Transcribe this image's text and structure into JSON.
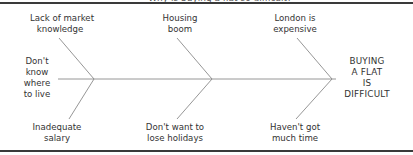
{
  "page": {
    "clipped_caption": "Why is buying a flat so difficult?"
  },
  "diagram": {
    "type": "fishbone",
    "effect": [
      "BUYING",
      "A FLAT",
      "IS",
      "DIFFICULT"
    ],
    "causes_top": [
      {
        "lines": [
          "Lack of market",
          "knowledge"
        ]
      },
      {
        "lines": [
          "Housing",
          "boom"
        ]
      },
      {
        "lines": [
          "London is",
          "expensive"
        ]
      }
    ],
    "cause_left": {
      "lines": [
        "Don't",
        "know",
        "where",
        "to live"
      ]
    },
    "causes_bottom": [
      {
        "lines": [
          "Inadequate",
          "salary"
        ]
      },
      {
        "lines": [
          "Don't want to",
          "lose holidays"
        ]
      },
      {
        "lines": [
          "Haven't got",
          "much time"
        ]
      }
    ],
    "line_color": "#8a8a8a"
  }
}
